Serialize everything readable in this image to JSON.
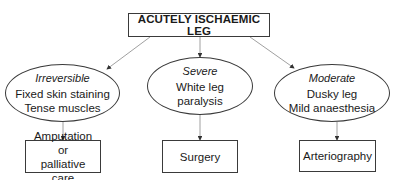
{
  "diagram": {
    "title": "ACUTELY ISCHAEMIC LEG",
    "branches": [
      {
        "category": "Irreversible",
        "signs": [
          "Fixed skin staining",
          "Tense muscles"
        ],
        "action": [
          "Amputation or",
          "palliative care"
        ]
      },
      {
        "category": "Severe",
        "signs": [
          "White leg",
          "paralysis"
        ],
        "action": [
          "Surgery"
        ]
      },
      {
        "category": "Moderate",
        "signs": [
          "Dusky leg",
          "Mild anaesthesia"
        ],
        "action": [
          "Arteriography"
        ]
      }
    ],
    "colors": {
      "line": "#888888",
      "border": "#3a3a3a",
      "text": "#1a1a1a",
      "background": "#ffffff"
    }
  }
}
